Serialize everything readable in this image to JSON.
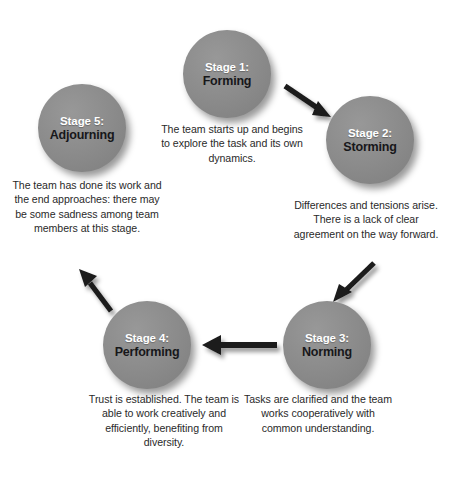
{
  "diagram": {
    "type": "cycle-diagram",
    "colors": {
      "circle_fill": "#8a8a8a",
      "stage_number_text": "#ffffff",
      "stage_name_text": "#17171a",
      "caption_text": "#2a2a2a",
      "arrow": "#1a1a1a",
      "background": "#ffffff"
    },
    "stages": [
      {
        "id": "stage-1",
        "number_label": "Stage 1:",
        "name": "Forming",
        "caption": "The team starts up and begins to explore the task and its own dynamics."
      },
      {
        "id": "stage-2",
        "number_label": "Stage 2:",
        "name": "Storming",
        "caption": "Differences and tensions arise. There is a lack of clear agreement on the way forward."
      },
      {
        "id": "stage-3",
        "number_label": "Stage 3:",
        "name": "Norming",
        "caption": "Tasks are clarified and the team works cooperatively with common understanding."
      },
      {
        "id": "stage-4",
        "number_label": "Stage 4:",
        "name": "Performing",
        "caption": "Trust is established. The team is able to work creatively and efficiently, benefiting from diversity."
      },
      {
        "id": "stage-5",
        "number_label": "Stage 5:",
        "name": "Adjourning",
        "caption": "The team has done its work and the end approaches: there may be some sadness among team members at this stage."
      }
    ],
    "arrows": [
      {
        "id": "arrow-1-to-2",
        "from": "Stage 1: Forming",
        "to": "Stage 2: Storming",
        "direction": "down-right"
      },
      {
        "id": "arrow-2-to-3",
        "from": "Stage 2: Storming",
        "to": "Stage 3: Norming",
        "direction": "down-left"
      },
      {
        "id": "arrow-3-to-4",
        "from": "Stage 3: Norming",
        "to": "Stage 4: Performing",
        "direction": "left"
      },
      {
        "id": "arrow-4-to-5",
        "from": "Stage 4: Performing",
        "to": "Stage 5: Adjourning",
        "direction": "up-left"
      }
    ]
  }
}
